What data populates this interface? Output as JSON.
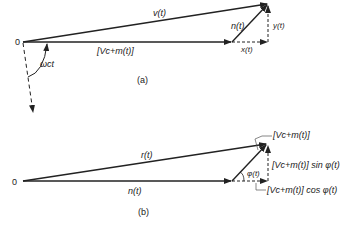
{
  "part_a": {
    "origin_label": "0",
    "v_label": "v(t)",
    "n_label": "n(t)",
    "carrier_label": "[V_c+m(t)]",
    "carrier_label_display": "[Vc+m(t)]",
    "x_label": "x(t)",
    "y_label": "y(t)",
    "angle_label": "ωct",
    "caption": "(a)"
  },
  "part_b": {
    "origin_label": "0",
    "r_label": "r(t)",
    "n_label": "n(t)",
    "phi_label": "φ(t)",
    "amplitude_label": "[Vc+m(t)]",
    "sin_label": "[Vc+m(t)] sin φ(t)",
    "cos_label": "[Vc+m(t)] cos φ(t)",
    "caption": "(b)"
  },
  "colors": {
    "ink": "#222222",
    "background": "#ffffff"
  }
}
